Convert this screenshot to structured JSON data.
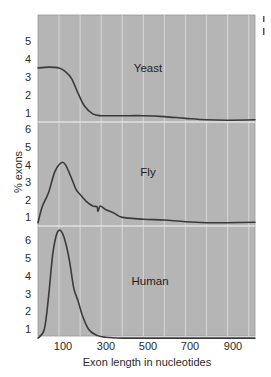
{
  "chart_data": {
    "type": "line",
    "title": "",
    "xlabel": "Exon length in nucleotides",
    "ylabel": "% exons",
    "x_ticks": [
      100,
      300,
      500,
      700,
      900
    ],
    "x_tick_labels": [
      "100",
      "300",
      "500",
      "700",
      "900"
    ],
    "xlim": [
      0,
      1030
    ],
    "grid": true,
    "gridline_interval_x": 100,
    "panels": [
      {
        "name": "Yeast",
        "y_ticks": [
          1,
          2,
          3,
          4,
          5
        ],
        "ylim": [
          0.5,
          6.4
        ],
        "x": [
          0,
          50,
          100,
          130,
          160,
          190,
          220,
          260,
          300,
          400,
          500,
          600,
          700,
          800,
          900,
          1030
        ],
        "values": [
          3.5,
          3.55,
          3.5,
          3.3,
          2.9,
          2.1,
          1.4,
          0.95,
          0.85,
          0.85,
          0.85,
          0.8,
          0.7,
          0.62,
          0.6,
          0.62
        ]
      },
      {
        "name": "Fly",
        "y_ticks": [
          1,
          2,
          3,
          4,
          5,
          6
        ],
        "ylim": [
          0.5,
          6.3
        ],
        "x": [
          0,
          20,
          50,
          80,
          110,
          130,
          160,
          180,
          200,
          230,
          260,
          280,
          285,
          295,
          320,
          360,
          400,
          500,
          600,
          700,
          800,
          900,
          1030
        ],
        "values": [
          0.7,
          1.6,
          2.4,
          3.6,
          4.1,
          4.0,
          3.2,
          2.6,
          2.3,
          1.9,
          1.65,
          1.6,
          1.35,
          1.65,
          1.45,
          1.25,
          1.0,
          0.9,
          0.85,
          0.75,
          0.7,
          0.7,
          0.72
        ]
      },
      {
        "name": "Human",
        "y_ticks": [
          1,
          2,
          3,
          4,
          5,
          6
        ],
        "ylim": [
          0.5,
          6.8
        ],
        "x": [
          0,
          30,
          50,
          70,
          90,
          110,
          130,
          150,
          170,
          190,
          210,
          240,
          280,
          320,
          400,
          500,
          700,
          900,
          1030
        ],
        "values": [
          0.5,
          1.0,
          2.8,
          5.2,
          6.4,
          6.5,
          5.9,
          4.8,
          3.3,
          2.6,
          1.8,
          1.0,
          0.65,
          0.55,
          0.5,
          0.5,
          0.5,
          0.5,
          0.5
        ]
      }
    ]
  },
  "labels": {
    "ylabel": "% exons",
    "xlabel": "Exon length in nucleotides",
    "panel_yeast": "Yeast",
    "panel_fly": "Fly",
    "panel_human": "Human",
    "x_tick_100": "100",
    "x_tick_300": "300",
    "x_tick_500": "500",
    "x_tick_700": "700",
    "x_tick_900": "900"
  },
  "colors": {
    "plot_background": "#b5b5b5",
    "gridline": "#d4d4d4",
    "curve": "#3a3a3a",
    "text": "#2a2a2a"
  }
}
